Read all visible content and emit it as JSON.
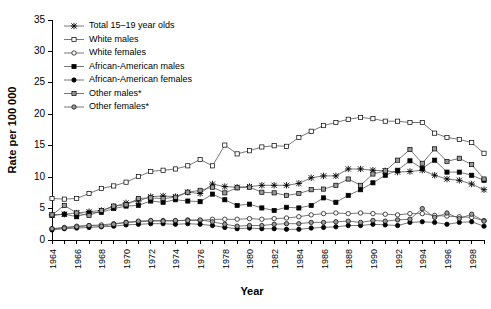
{
  "chart_data": {
    "type": "line",
    "title": "",
    "xlabel": "Year",
    "ylabel": "Rate per 100 000",
    "xlim": [
      1964,
      1999
    ],
    "ylim": [
      0,
      35
    ],
    "ytick_step": 5,
    "yticks": [
      0,
      5,
      10,
      15,
      20,
      25,
      30,
      35
    ],
    "grid": false,
    "legend_position": "top-left-inside",
    "footnote_marker": "*",
    "x": [
      1964,
      1965,
      1966,
      1967,
      1968,
      1969,
      1970,
      1971,
      1972,
      1973,
      1974,
      1975,
      1976,
      1977,
      1978,
      1979,
      1980,
      1981,
      1982,
      1983,
      1984,
      1985,
      1986,
      1987,
      1988,
      1989,
      1990,
      1991,
      1992,
      1993,
      1994,
      1995,
      1996,
      1997,
      1998,
      1999
    ],
    "xtick_labels": [
      "1964",
      "1966",
      "1968",
      "1970",
      "1972",
      "1974",
      "1976",
      "1978",
      "1980",
      "1982",
      "1984",
      "1986",
      "1988",
      "1990",
      "1992",
      "1994",
      "1996",
      "1998"
    ],
    "series": [
      {
        "name": "Total 15–19 year olds",
        "marker": "star",
        "fill": "#000000",
        "values": [
          4.0,
          4.1,
          4.3,
          4.5,
          4.7,
          5.3,
          5.9,
          6.2,
          6.9,
          7.0,
          6.9,
          7.6,
          7.4,
          8.9,
          8.5,
          8.4,
          8.5,
          8.7,
          8.7,
          8.7,
          9.0,
          9.9,
          10.2,
          10.2,
          11.3,
          11.3,
          11.1,
          11.0,
          10.8,
          10.9,
          11.1,
          10.3,
          9.7,
          9.5,
          8.9,
          8.0
        ]
      },
      {
        "name": "White males",
        "marker": "open-square",
        "fill": "#ffffff",
        "values": [
          6.6,
          6.5,
          6.6,
          7.4,
          8.2,
          8.6,
          9.2,
          10.1,
          10.9,
          11.1,
          11.3,
          11.8,
          12.8,
          11.8,
          15.1,
          13.7,
          14.2,
          14.8,
          15.0,
          14.9,
          16.3,
          17.3,
          18.2,
          18.7,
          19.2,
          19.5,
          19.3,
          18.9,
          18.9,
          18.7,
          18.7,
          17.0,
          16.3,
          16.0,
          15.5,
          13.8
        ]
      },
      {
        "name": "White females",
        "marker": "open-circle",
        "fill": "#ffffff",
        "values": [
          1.8,
          2.0,
          2.2,
          2.3,
          2.4,
          2.6,
          2.8,
          2.9,
          3.0,
          3.1,
          3.0,
          3.2,
          3.1,
          3.3,
          3.3,
          3.3,
          3.4,
          3.3,
          3.4,
          3.5,
          3.7,
          4.0,
          4.2,
          4.3,
          4.2,
          4.3,
          4.2,
          4.1,
          4.0,
          4.2,
          4.2,
          3.9,
          3.8,
          3.7,
          3.6,
          3.1
        ]
      },
      {
        "name": "African-American males",
        "marker": "filled-square",
        "fill": "#000000",
        "values": [
          3.9,
          4.1,
          3.7,
          4.3,
          4.4,
          5.0,
          5.4,
          5.5,
          6.2,
          6.0,
          6.4,
          6.2,
          6.1,
          7.3,
          6.4,
          5.5,
          5.7,
          5.1,
          4.7,
          5.2,
          5.1,
          5.5,
          6.7,
          6.0,
          7.1,
          8.0,
          9.1,
          10.3,
          11.1,
          12.6,
          11.4,
          12.7,
          10.8,
          10.8,
          10.3,
          9.5
        ]
      },
      {
        "name": "African-American females",
        "marker": "filled-circle",
        "fill": "#000000",
        "values": [
          1.6,
          1.8,
          1.9,
          2.0,
          2.1,
          2.2,
          2.4,
          2.5,
          2.6,
          2.6,
          2.5,
          2.6,
          2.5,
          2.3,
          2.0,
          1.8,
          1.9,
          1.8,
          1.8,
          1.7,
          1.7,
          1.9,
          2.0,
          2.1,
          2.3,
          2.3,
          2.5,
          2.4,
          2.3,
          2.8,
          2.9,
          2.8,
          2.5,
          2.8,
          2.9,
          2.2
        ]
      },
      {
        "name": "Other males*",
        "marker": "grey-square",
        "fill": "#9a9a9a",
        "values": [
          4.0,
          5.5,
          4.3,
          3.9,
          4.7,
          5.4,
          5.6,
          6.6,
          6.7,
          6.6,
          6.8,
          7.6,
          7.9,
          8.4,
          7.5,
          8.3,
          8.4,
          7.6,
          7.5,
          7.1,
          7.4,
          8.0,
          8.1,
          8.7,
          9.7,
          8.7,
          10.5,
          11.0,
          12.7,
          14.4,
          12.2,
          14.5,
          12.5,
          13.0,
          12.0,
          9.7
        ]
      },
      {
        "name": "Other females*",
        "marker": "grey-circle",
        "fill": "#9a9a9a",
        "values": [
          1.8,
          1.9,
          2.1,
          2.3,
          2.2,
          2.5,
          2.8,
          3.0,
          3.1,
          3.0,
          3.1,
          3.1,
          3.2,
          2.9,
          2.5,
          2.2,
          2.3,
          2.3,
          2.5,
          2.6,
          2.6,
          2.8,
          2.8,
          2.9,
          3.0,
          2.8,
          3.1,
          3.0,
          3.2,
          3.3,
          5.0,
          3.6,
          4.3,
          3.4,
          4.1,
          3.0
        ]
      }
    ]
  },
  "axes": {
    "y_title": "Rate per 100 000",
    "x_title": "Year"
  }
}
